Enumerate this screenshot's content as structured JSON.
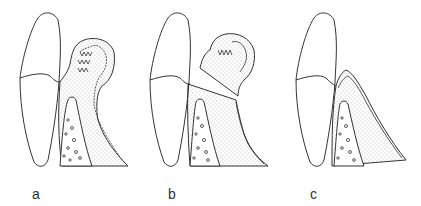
{
  "figure": {
    "panels": [
      {
        "id": "a",
        "label": "a"
      },
      {
        "id": "b",
        "label": "b"
      },
      {
        "id": "c",
        "label": "c"
      }
    ],
    "colors": {
      "line": "#333333",
      "stipple": "#666666",
      "background": "#ffffff"
    }
  }
}
